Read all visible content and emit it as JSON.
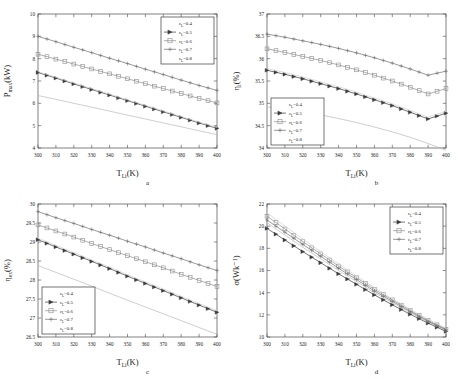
{
  "figure": {
    "panels": [
      "a",
      "b",
      "c",
      "d"
    ],
    "series_colors": [
      "#b9b9b9",
      "#3b3b3b",
      "#8d8d8d",
      "#6e6e6e",
      "#cfcfcf"
    ],
    "axis_color": "#4a4a4a"
  },
  "legend": {
    "entries": [
      {
        "label": "ε",
        "sub": "L",
        "value": "=0.4",
        "marker": "none"
      },
      {
        "label": "ε",
        "sub": "L",
        "value": "=0.5",
        "marker": "triangle"
      },
      {
        "label": "ε",
        "sub": "L",
        "value": "=0.6",
        "marker": "square"
      },
      {
        "label": "ε",
        "sub": "L",
        "value": "=0.7",
        "marker": "plus"
      },
      {
        "label": "ε",
        "sub": "L",
        "value": "=0.8",
        "marker": "none"
      }
    ]
  },
  "chart_data": [
    {
      "id": "a",
      "type": "line",
      "panel_letter": "a",
      "title": "",
      "xlabel": "T",
      "xlabel_sub": "Li",
      "xlabel_unit": "(K)",
      "ylabel": "P",
      "ylabel_sub": "max",
      "ylabel_unit": "(kW)",
      "xlim": [
        300,
        400
      ],
      "ylim": [
        4,
        10
      ],
      "xticks": [
        300,
        310,
        320,
        330,
        340,
        350,
        360,
        370,
        380,
        390,
        400
      ],
      "yticks": [
        4,
        5,
        6,
        7,
        8,
        9,
        10
      ],
      "ytick_labels": [
        "4",
        "5",
        "6",
        "7",
        "8",
        "9",
        "10"
      ],
      "grid": false,
      "legend_position": "top-right",
      "x": [
        300,
        310,
        320,
        330,
        340,
        350,
        360,
        370,
        380,
        390,
        400
      ],
      "series": [
        {
          "name": "εL=0.4",
          "marker": "none",
          "values": [
            6.35,
            6.18,
            6.0,
            5.83,
            5.65,
            5.47,
            5.3,
            5.12,
            4.95,
            4.77,
            4.6
          ]
        },
        {
          "name": "εL=0.5",
          "marker": "triangle",
          "values": [
            7.38,
            7.13,
            6.87,
            6.62,
            6.37,
            6.12,
            5.87,
            5.62,
            5.37,
            5.12,
            4.88
          ]
        },
        {
          "name": "εL=0.6",
          "marker": "square",
          "values": [
            8.2,
            7.98,
            7.76,
            7.54,
            7.32,
            7.1,
            6.88,
            6.66,
            6.44,
            6.22,
            6.02
          ]
        },
        {
          "name": "εL=0.7",
          "marker": "plus",
          "values": [
            9.0,
            8.76,
            8.51,
            8.27,
            8.02,
            7.78,
            7.53,
            7.29,
            7.04,
            6.8,
            6.58
          ]
        },
        {
          "name": "εL=0.8",
          "marker": "none",
          "values": [
            7.42,
            7.17,
            6.91,
            6.66,
            6.41,
            6.16,
            5.91,
            5.66,
            5.41,
            5.16,
            4.92
          ]
        }
      ]
    },
    {
      "id": "b",
      "type": "line",
      "panel_letter": "b",
      "title": "",
      "xlabel": "T",
      "xlabel_sub": "Li",
      "xlabel_unit": "(K)",
      "ylabel": "η",
      "ylabel_sub": "t",
      "ylabel_unit": "(%)",
      "xlim": [
        300,
        400
      ],
      "ylim": [
        34,
        37
      ],
      "xticks": [
        300,
        310,
        320,
        330,
        340,
        350,
        360,
        370,
        380,
        390,
        400
      ],
      "yticks": [
        34,
        34.5,
        35,
        35.5,
        36,
        36.5,
        37
      ],
      "ytick_labels": [
        "34",
        "34.5",
        "35",
        "35.5",
        "36",
        "36.5",
        "37"
      ],
      "grid": false,
      "legend_position": "bottom-left",
      "x": [
        300,
        310,
        320,
        330,
        340,
        350,
        360,
        370,
        380,
        390,
        400
      ],
      "series": [
        {
          "name": "εL=0.4",
          "marker": "none",
          "values": [
            34.92,
            34.87,
            34.81,
            34.74,
            34.66,
            34.57,
            34.47,
            34.36,
            34.24,
            34.1,
            33.95
          ]
        },
        {
          "name": "εL=0.5",
          "marker": "triangle",
          "values": [
            35.74,
            35.65,
            35.55,
            35.44,
            35.33,
            35.21,
            35.08,
            34.95,
            34.8,
            34.65,
            34.78
          ]
        },
        {
          "name": "εL=0.6",
          "marker": "square",
          "values": [
            36.22,
            36.14,
            36.05,
            35.96,
            35.86,
            35.75,
            35.63,
            35.5,
            35.36,
            35.21,
            35.33
          ]
        },
        {
          "name": "εL=0.7",
          "marker": "plus",
          "values": [
            36.55,
            36.48,
            36.4,
            36.32,
            36.23,
            36.13,
            36.02,
            35.9,
            35.77,
            35.63,
            35.72
          ]
        },
        {
          "name": "εL=0.8",
          "marker": "none",
          "values": [
            35.78,
            35.69,
            35.59,
            35.48,
            35.37,
            35.25,
            35.12,
            34.99,
            34.84,
            34.69,
            34.82
          ]
        }
      ]
    },
    {
      "id": "c",
      "type": "line",
      "panel_letter": "c",
      "title": "",
      "xlabel": "T",
      "xlabel_sub": "Li",
      "xlabel_unit": "(K)",
      "ylabel": "η",
      "ylabel_sub": "ex",
      "ylabel_unit": "(%)",
      "xlim": [
        300,
        400
      ],
      "ylim": [
        26.5,
        30
      ],
      "xticks": [
        300,
        310,
        320,
        330,
        340,
        350,
        360,
        370,
        380,
        390,
        400
      ],
      "yticks": [
        26.5,
        27,
        27.5,
        28,
        28.5,
        29,
        29.5,
        30
      ],
      "ytick_labels": [
        "26.5",
        "27",
        "27.5",
        "28",
        "28.5",
        "29",
        "29.5",
        "30"
      ],
      "grid": false,
      "legend_position": "bottom-left",
      "x": [
        300,
        310,
        320,
        330,
        340,
        350,
        360,
        370,
        380,
        390,
        400
      ],
      "series": [
        {
          "name": "εL=0.4",
          "marker": "none",
          "values": [
            28.38,
            28.2,
            28.02,
            27.84,
            27.65,
            27.47,
            27.29,
            27.11,
            26.93,
            26.75,
            26.57
          ]
        },
        {
          "name": "εL=0.5",
          "marker": "triangle",
          "values": [
            29.06,
            28.87,
            28.68,
            28.49,
            28.3,
            28.1,
            27.91,
            27.72,
            27.53,
            27.34,
            27.15
          ]
        },
        {
          "name": "εL=0.6",
          "marker": "square",
          "values": [
            29.45,
            29.29,
            29.13,
            28.96,
            28.8,
            28.64,
            28.48,
            28.32,
            28.15,
            27.99,
            27.83
          ]
        },
        {
          "name": "εL=0.7",
          "marker": "plus",
          "values": [
            29.8,
            29.64,
            29.49,
            29.33,
            29.18,
            29.02,
            28.87,
            28.71,
            28.56,
            28.4,
            28.25
          ]
        },
        {
          "name": "εL=0.8",
          "marker": "none",
          "values": [
            29.1,
            28.91,
            28.72,
            28.53,
            28.34,
            28.14,
            27.95,
            27.76,
            27.57,
            27.38,
            27.19
          ]
        }
      ]
    },
    {
      "id": "d",
      "type": "line",
      "panel_letter": "d",
      "title": "",
      "xlabel": "T",
      "xlabel_sub": "Li",
      "xlabel_unit": "(K)",
      "ylabel": "σ",
      "ylabel_sub": "",
      "ylabel_unit": "(Wk⁻¹)",
      "xlim": [
        300,
        400
      ],
      "ylim": [
        10,
        22
      ],
      "xticks": [
        300,
        310,
        320,
        330,
        340,
        350,
        360,
        370,
        380,
        390,
        400
      ],
      "yticks": [
        10,
        12,
        14,
        16,
        18,
        20,
        22
      ],
      "ytick_labels": [
        "10",
        "12",
        "14",
        "16",
        "18",
        "20",
        "22"
      ],
      "grid": false,
      "legend_position": "top-right",
      "x": [
        300,
        310,
        320,
        330,
        340,
        350,
        360,
        370,
        380,
        390,
        400
      ],
      "series": [
        {
          "name": "εL=0.4",
          "marker": "none",
          "values": [
            20.3,
            19.2,
            18.1,
            17.05,
            16.0,
            15.0,
            14.0,
            13.1,
            12.2,
            11.35,
            10.6
          ]
        },
        {
          "name": "εL=0.5",
          "marker": "triangle",
          "values": [
            19.8,
            18.75,
            17.7,
            16.7,
            15.7,
            14.75,
            13.8,
            12.9,
            12.05,
            11.25,
            10.5
          ]
        },
        {
          "name": "εL=0.6",
          "marker": "square",
          "values": [
            20.9,
            19.75,
            18.6,
            17.5,
            16.4,
            15.35,
            14.3,
            13.35,
            12.4,
            11.5,
            10.7
          ]
        },
        {
          "name": "εL=0.7",
          "marker": "plus",
          "values": [
            20.55,
            19.45,
            18.35,
            17.28,
            16.2,
            15.18,
            14.15,
            13.22,
            12.3,
            11.42,
            10.65
          ]
        },
        {
          "name": "εL=0.8",
          "marker": "none",
          "values": [
            21.2,
            20.0,
            18.85,
            17.7,
            16.6,
            15.5,
            14.45,
            13.45,
            12.5,
            11.6,
            10.8
          ]
        }
      ]
    }
  ]
}
